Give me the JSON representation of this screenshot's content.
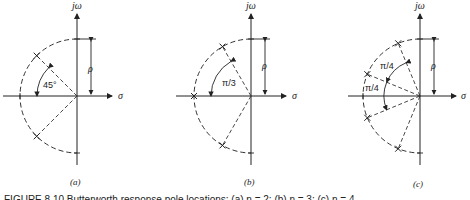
{
  "figure": {
    "caption": "FIGURE 8.10   Butterworth response pole locations: (a) n = 2; (b) n = 3; (c) n = 4.",
    "axis_labels": {
      "vertical": "jω",
      "horizontal": "σ",
      "radius": "ρ"
    },
    "panels": [
      {
        "id": "a",
        "label": "(a)",
        "n": 2,
        "angle_label": "45°",
        "pole_angles_deg": [
          135,
          225
        ]
      },
      {
        "id": "b",
        "label": "(b)",
        "n": 3,
        "angle_label": "π/3",
        "pole_angles_deg": [
          120,
          180,
          240
        ]
      },
      {
        "id": "c",
        "label": "(c)",
        "n": 4,
        "angle_labels": [
          "π/4",
          "π/4"
        ],
        "pole_angles_deg": [
          112.5,
          157.5,
          202.5,
          247.5
        ]
      }
    ]
  }
}
